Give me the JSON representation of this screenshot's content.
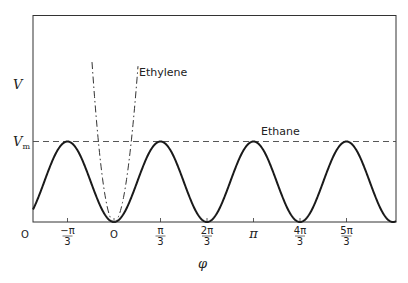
{
  "chart_data": {
    "type": "line",
    "title": "",
    "xlabel": "φ",
    "ylabel": "V",
    "x_ticks": [
      {
        "value": -1.0472,
        "label_num": "−π",
        "label_den": "3"
      },
      {
        "value": 0,
        "label": "O"
      },
      {
        "value": 1.0472,
        "label_num": "π",
        "label_den": "3"
      },
      {
        "value": 2.0944,
        "label_num": "2π",
        "label_den": "3"
      },
      {
        "value": 3.1416,
        "label": "π"
      },
      {
        "value": 4.1888,
        "label_num": "4π",
        "label_den": "3"
      },
      {
        "value": 5.236,
        "label_num": "5π",
        "label_den": "3"
      }
    ],
    "origin_label": "O",
    "xlim": [
      -1.8175,
      5.9
    ],
    "ylim": [
      0,
      2.55
    ],
    "y_reference": {
      "label": "V",
      "sub": "m",
      "value": 1,
      "style": "dashed"
    },
    "grid": false,
    "legend": "inline",
    "series": [
      {
        "name": "Ethane",
        "style": "solid",
        "formula": "V = Vm/2 · (1 − cos 3φ)",
        "x": [
          -1.8175,
          -1.0472,
          -0.5236,
          0,
          0.5236,
          1.0472,
          1.5708,
          2.0944,
          2.618,
          3.1416,
          3.6652,
          4.1888,
          4.7124,
          5.236,
          5.7596
        ],
        "y": [
          0.21,
          1,
          0.5,
          0,
          0.5,
          1,
          0.5,
          0,
          0.5,
          1,
          0.5,
          0,
          0.5,
          1,
          0.5
        ]
      },
      {
        "name": "Ethylene",
        "style": "dash-dot",
        "formula": "V ≈ k·φ² (steep well about φ = 0)",
        "x": [
          -0.515,
          -0.37,
          0,
          0.37,
          0.565
        ],
        "y": [
          2.55,
          1,
          0,
          1,
          2.55
        ]
      }
    ],
    "annotations": [
      {
        "text": "Ethylene",
        "near": "ethylene curve, upper right branch"
      },
      {
        "text": "Ethane",
        "near": "above Vm dashed line"
      }
    ]
  },
  "labels": {
    "y_axis": "V",
    "vm_main": "V",
    "vm_sub": "m",
    "x_axis": "φ",
    "origin": "O",
    "ethylene": "Ethylene",
    "ethane": "Ethane",
    "ticks": [
      {
        "num": "−π",
        "den": "3"
      },
      {
        "plain": "O"
      },
      {
        "num": "π",
        "den": "3"
      },
      {
        "num": "2π",
        "den": "3"
      },
      {
        "plain": "π"
      },
      {
        "num": "4π",
        "den": "3"
      },
      {
        "num": "5π",
        "den": "3"
      }
    ]
  }
}
